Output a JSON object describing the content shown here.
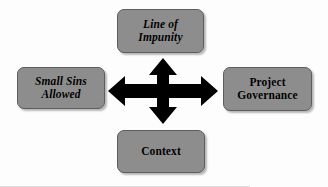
{
  "diagram": {
    "type": "four-way-relationship",
    "background_color": "#fdfdfd",
    "node_fill_color": "#8d8d8d",
    "node_border_color": "#5d5d5d",
    "text_color": "#000000",
    "connector_color": "#000000",
    "nodes": {
      "top": {
        "label": "Line of\nImpunity",
        "style": "bold-italic",
        "position": "top"
      },
      "left": {
        "label": "Small Sins\nAllowed",
        "style": "bold-italic",
        "position": "left"
      },
      "right": {
        "label": "Project\nGovernance",
        "style": "bold",
        "position": "right"
      },
      "bottom": {
        "label": "Context",
        "style": "bold",
        "position": "bottom"
      }
    },
    "connector": {
      "name": "four-way-arrow",
      "directions": [
        "up",
        "down",
        "left",
        "right"
      ]
    }
  }
}
